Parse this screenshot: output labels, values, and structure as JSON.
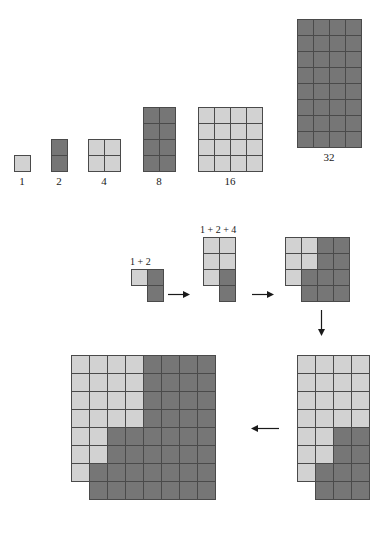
{
  "figure": {
    "title_row_label": "powers of two rectangles",
    "colors": {
      "light_cell": "#d2d2d2",
      "dark_cell": "#767676",
      "cell_border": "#4a4a4a",
      "background": "#ffffff",
      "arrow": "#1a1a1a",
      "text": "#1a1a1a"
    },
    "top_row": {
      "blocks": [
        {
          "caption": "1",
          "cols": 1,
          "rows": 1,
          "cell": 16,
          "x": 14,
          "y": 155,
          "pattern": [
            [
              "light"
            ]
          ]
        },
        {
          "caption": "2",
          "cols": 1,
          "rows": 2,
          "cell": 16,
          "x": 51,
          "y": 139,
          "pattern": [
            [
              "dark"
            ],
            [
              "dark"
            ]
          ]
        },
        {
          "caption": "4",
          "cols": 2,
          "rows": 2,
          "cell": 16,
          "x": 88,
          "y": 139,
          "pattern": [
            [
              "light",
              "light"
            ],
            [
              "light",
              "light"
            ]
          ]
        },
        {
          "caption": "8",
          "cols": 2,
          "rows": 4,
          "cell": 16,
          "x": 143,
          "y": 107,
          "pattern": [
            [
              "dark",
              "dark"
            ],
            [
              "dark",
              "dark"
            ],
            [
              "dark",
              "dark"
            ],
            [
              "dark",
              "dark"
            ]
          ]
        },
        {
          "caption": "16",
          "cols": 4,
          "rows": 4,
          "cell": 16,
          "x": 198,
          "y": 107,
          "pattern": [
            [
              "light",
              "light",
              "light",
              "light"
            ],
            [
              "light",
              "light",
              "light",
              "light"
            ],
            [
              "light",
              "light",
              "light",
              "light"
            ],
            [
              "light",
              "light",
              "light",
              "light"
            ]
          ]
        },
        {
          "caption": "32",
          "cols": 4,
          "rows": 8,
          "cell": 16,
          "x": 297,
          "y": 19,
          "pattern": [
            [
              "dark",
              "dark",
              "dark",
              "dark"
            ],
            [
              "dark",
              "dark",
              "dark",
              "dark"
            ],
            [
              "dark",
              "dark",
              "dark",
              "dark"
            ],
            [
              "dark",
              "dark",
              "dark",
              "dark"
            ],
            [
              "dark",
              "dark",
              "dark",
              "dark"
            ],
            [
              "dark",
              "dark",
              "dark",
              "dark"
            ],
            [
              "dark",
              "dark",
              "dark",
              "dark"
            ],
            [
              "dark",
              "dark",
              "dark",
              "dark"
            ]
          ]
        }
      ]
    },
    "middle_row": {
      "shapes": [
        {
          "name": "shape-1-plus-2",
          "label": "1 + 2",
          "label_x": 130,
          "label_y": 256,
          "cols": 2,
          "rows": 2,
          "cell": 16,
          "x": 131,
          "y": 269,
          "pattern": [
            [
              "light",
              "dark"
            ],
            [
              "empty",
              "dark"
            ]
          ]
        },
        {
          "name": "shape-1-plus-2-plus-4",
          "label": "1 + 2 + 4",
          "label_x": 200,
          "label_y": 224,
          "cols": 2,
          "rows": 4,
          "cell": 16,
          "x": 203,
          "y": 237,
          "pattern": [
            [
              "light",
              "light"
            ],
            [
              "light",
              "light"
            ],
            [
              "light",
              "dark"
            ],
            [
              "empty",
              "dark"
            ]
          ]
        },
        {
          "name": "shape-1-plus-2-plus-4-plus-8",
          "label": "",
          "label_x": 0,
          "label_y": 0,
          "cols": 4,
          "rows": 4,
          "cell": 16,
          "x": 285,
          "y": 237,
          "pattern": [
            [
              "light",
              "light",
              "dark",
              "dark"
            ],
            [
              "light",
              "light",
              "dark",
              "dark"
            ],
            [
              "light",
              "dark",
              "dark",
              "dark"
            ],
            [
              "empty",
              "dark",
              "dark",
              "dark"
            ]
          ]
        }
      ],
      "arrows": [
        {
          "name": "arrow-right-1",
          "x": 168,
          "y": 290,
          "dir": "right",
          "length": 22
        },
        {
          "name": "arrow-right-2",
          "x": 252,
          "y": 290,
          "dir": "right",
          "length": 22
        },
        {
          "name": "arrow-down-1",
          "x": 317,
          "y": 310,
          "dir": "down",
          "length": 26
        }
      ]
    },
    "bottom_row": {
      "shapes": [
        {
          "name": "shape-sum-63",
          "cols": 8,
          "rows": 8,
          "cell": 18,
          "x": 71,
          "y": 355,
          "pattern": [
            [
              "light",
              "light",
              "light",
              "light",
              "dark",
              "dark",
              "dark",
              "dark"
            ],
            [
              "light",
              "light",
              "light",
              "light",
              "dark",
              "dark",
              "dark",
              "dark"
            ],
            [
              "light",
              "light",
              "light",
              "light",
              "dark",
              "dark",
              "dark",
              "dark"
            ],
            [
              "light",
              "light",
              "light",
              "light",
              "dark",
              "dark",
              "dark",
              "dark"
            ],
            [
              "light",
              "light",
              "dark",
              "dark",
              "dark",
              "dark",
              "dark",
              "dark"
            ],
            [
              "light",
              "light",
              "dark",
              "dark",
              "dark",
              "dark",
              "dark",
              "dark"
            ],
            [
              "light",
              "dark",
              "dark",
              "dark",
              "dark",
              "dark",
              "dark",
              "dark"
            ],
            [
              "empty",
              "dark",
              "dark",
              "dark",
              "dark",
              "dark",
              "dark",
              "dark"
            ]
          ]
        },
        {
          "name": "shape-sum-31",
          "cols": 4,
          "rows": 8,
          "cell": 18,
          "x": 297,
          "y": 355,
          "pattern": [
            [
              "light",
              "light",
              "light",
              "light"
            ],
            [
              "light",
              "light",
              "light",
              "light"
            ],
            [
              "light",
              "light",
              "light",
              "light"
            ],
            [
              "light",
              "light",
              "light",
              "light"
            ],
            [
              "light",
              "light",
              "dark",
              "dark"
            ],
            [
              "light",
              "light",
              "dark",
              "dark"
            ],
            [
              "light",
              "dark",
              "dark",
              "dark"
            ],
            [
              "empty",
              "dark",
              "dark",
              "dark"
            ]
          ]
        }
      ],
      "arrows": [
        {
          "name": "arrow-left-1",
          "x": 251,
          "y": 424,
          "dir": "left",
          "length": 28
        }
      ]
    }
  }
}
